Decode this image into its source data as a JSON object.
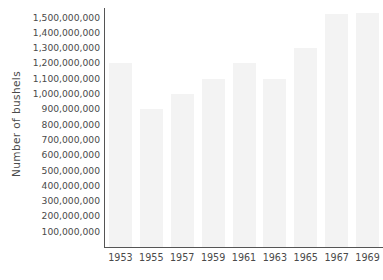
{
  "chart_data": {
    "type": "bar",
    "title": "",
    "subtitle": "",
    "xlabel": "",
    "ylabel": "Number of bushels",
    "categories": [
      "1953",
      "1955",
      "1957",
      "1959",
      "1961",
      "1963",
      "1965",
      "1967",
      "1969"
    ],
    "values": [
      1200000000,
      900000000,
      1000000000,
      1100000000,
      1200000000,
      1100000000,
      1300000000,
      1520000000,
      1530000000
    ],
    "ylim": [
      0,
      1530000000
    ],
    "y_ticks": [
      100000000,
      200000000,
      300000000,
      400000000,
      500000000,
      600000000,
      700000000,
      800000000,
      900000000,
      1000000000,
      1100000000,
      1200000000,
      1300000000,
      1400000000,
      1500000000
    ],
    "y_tick_labels": [
      "100,000,000",
      "200,000,000",
      "300,000,000",
      "400,000,000",
      "500,000,000",
      "600,000,000",
      "700,000,000",
      "800,000,000",
      "900,000,000",
      "1,000,000,000",
      "1,100,000,000",
      "1,200,000,000",
      "1,300,000,000",
      "1,400,000,000",
      "1,500,000,000"
    ],
    "grid": false,
    "legend": null,
    "legend_position": "none",
    "bar_color": "#f3f3f3",
    "axis_color": "#555555",
    "text_color": "#4a4a4a",
    "background_color": "#ffffff"
  }
}
